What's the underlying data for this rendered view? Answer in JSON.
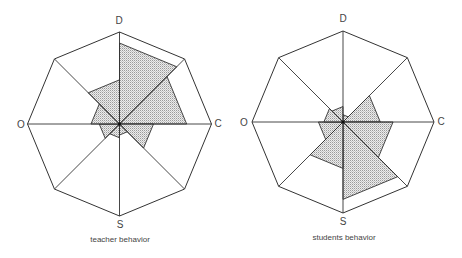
{
  "diagrams": [
    {
      "id": "teacher",
      "caption": "teacher behavior",
      "center": [
        119.5,
        124
      ],
      "radius": 92,
      "axis_labels": {
        "top": "D",
        "right": "C",
        "bottom": "S",
        "left": "O"
      },
      "octant_order": [
        "N-NE",
        "NE-E",
        "E-SE",
        "SE-S",
        "S-SW",
        "SW-W",
        "W-NW",
        "NW-N"
      ],
      "octant_values": [
        0.88,
        0.73,
        0.37,
        0.12,
        0.15,
        0.22,
        0.31,
        0.48
      ]
    },
    {
      "id": "students",
      "caption": "students behavior",
      "center": [
        343,
        122
      ],
      "radius": 91,
      "axis_labels": {
        "top": "D",
        "right": "C",
        "bottom": "S",
        "left": "O"
      },
      "octant_order": [
        "N-NE",
        "NE-E",
        "E-SE",
        "SE-S",
        "S-SW",
        "SW-W",
        "W-NW",
        "NW-N"
      ],
      "octant_values": [
        0.08,
        0.41,
        0.55,
        0.85,
        0.51,
        0.27,
        0.21,
        0.17
      ]
    }
  ],
  "colors": {
    "line": "#333333",
    "fill": "#d4d4d4",
    "fill_dot": "#9a9a9a"
  }
}
